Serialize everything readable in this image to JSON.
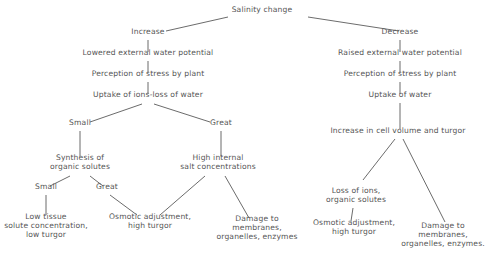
{
  "diagram": {
    "title": "Salinity change",
    "nodes": {
      "root": {
        "lines": [
          "Salinity change"
        ],
        "x": 262,
        "y": 9
      },
      "increase": {
        "lines": [
          "Increase"
        ],
        "x": 148,
        "y": 31
      },
      "inc_lowered": {
        "lines": [
          "Lowered external water potential"
        ],
        "x": 148,
        "y": 52
      },
      "inc_perception": {
        "lines": [
          "Perception of stress by plant"
        ],
        "x": 148,
        "y": 73
      },
      "inc_uptake": {
        "lines": [
          "Uptake of ions-loss of water"
        ],
        "x": 148,
        "y": 94
      },
      "inc_small": {
        "lines": [
          "Small"
        ],
        "x": 80,
        "y": 122
      },
      "inc_great": {
        "lines": [
          "Great"
        ],
        "x": 221,
        "y": 122
      },
      "synthesis": {
        "lines": [
          "Synthesis of",
          "organic solutes"
        ],
        "x": 80,
        "y": 157
      },
      "high_internal": {
        "lines": [
          "High internal",
          "salt concentrations"
        ],
        "x": 218,
        "y": 157
      },
      "syn_small": {
        "lines": [
          "Small"
        ],
        "x": 46,
        "y": 186
      },
      "syn_great": {
        "lines": [
          "Great"
        ],
        "x": 107,
        "y": 186
      },
      "low_tissue": {
        "lines": [
          "Low tissue",
          "solute concentration,",
          "low turgor"
        ],
        "x": 46,
        "y": 216
      },
      "osmotic_left": {
        "lines": [
          "Osmotic adjustment,",
          "high turgor"
        ],
        "x": 150,
        "y": 216
      },
      "damage_left": {
        "lines": [
          "Damage to",
          "membranes,",
          "organelles, enzymes"
        ],
        "x": 257,
        "y": 218
      },
      "decrease": {
        "lines": [
          "Decrease"
        ],
        "x": 400,
        "y": 31
      },
      "dec_raised": {
        "lines": [
          "Raised external water potential"
        ],
        "x": 400,
        "y": 52
      },
      "dec_perception": {
        "lines": [
          "Perception of stress by plant"
        ],
        "x": 400,
        "y": 73
      },
      "dec_uptake": {
        "lines": [
          "Uptake of water"
        ],
        "x": 400,
        "y": 94
      },
      "cell_volume": {
        "lines": [
          "Increase in cell volume and turgor"
        ],
        "x": 398,
        "y": 130
      },
      "loss_ions": {
        "lines": [
          "Loss of ions,",
          "organic solutes"
        ],
        "x": 356,
        "y": 190
      },
      "osmotic_right": {
        "lines": [
          "Osmotic adjustment,",
          "high turgor"
        ],
        "x": 354,
        "y": 222
      },
      "damage_right": {
        "lines": [
          "Damage to",
          "membranes,",
          "organelles, enzymes."
        ],
        "x": 443,
        "y": 225
      }
    },
    "edges": [
      {
        "x1": 228,
        "y1": 17,
        "x2": 166,
        "y2": 31
      },
      {
        "x1": 308,
        "y1": 17,
        "x2": 399,
        "y2": 31
      },
      {
        "x1": 148,
        "y1": 40,
        "x2": 148,
        "y2": 52
      },
      {
        "x1": 148,
        "y1": 61,
        "x2": 148,
        "y2": 73
      },
      {
        "x1": 148,
        "y1": 82,
        "x2": 148,
        "y2": 94
      },
      {
        "x1": 142,
        "y1": 104,
        "x2": 90,
        "y2": 122
      },
      {
        "x1": 154,
        "y1": 104,
        "x2": 210,
        "y2": 122
      },
      {
        "x1": 80,
        "y1": 131,
        "x2": 80,
        "y2": 156
      },
      {
        "x1": 221,
        "y1": 131,
        "x2": 221,
        "y2": 156
      },
      {
        "x1": 70,
        "y1": 176,
        "x2": 50,
        "y2": 186
      },
      {
        "x1": 90,
        "y1": 176,
        "x2": 103,
        "y2": 186
      },
      {
        "x1": 46,
        "y1": 195,
        "x2": 46,
        "y2": 215
      },
      {
        "x1": 110,
        "y1": 195,
        "x2": 137,
        "y2": 215
      },
      {
        "x1": 205,
        "y1": 176,
        "x2": 160,
        "y2": 215
      },
      {
        "x1": 225,
        "y1": 176,
        "x2": 249,
        "y2": 218
      },
      {
        "x1": 400,
        "y1": 40,
        "x2": 400,
        "y2": 52
      },
      {
        "x1": 400,
        "y1": 61,
        "x2": 400,
        "y2": 73
      },
      {
        "x1": 400,
        "y1": 82,
        "x2": 400,
        "y2": 94
      },
      {
        "x1": 400,
        "y1": 103,
        "x2": 400,
        "y2": 129
      },
      {
        "x1": 395,
        "y1": 139,
        "x2": 363,
        "y2": 180
      },
      {
        "x1": 403,
        "y1": 139,
        "x2": 445,
        "y2": 222
      },
      {
        "x1": 353,
        "y1": 208,
        "x2": 351,
        "y2": 221
      }
    ]
  }
}
